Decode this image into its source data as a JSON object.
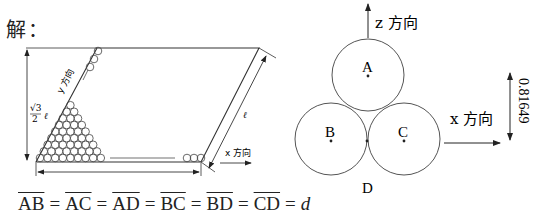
{
  "header": {
    "label": "解："
  },
  "left_figure": {
    "height_label_num": "√3",
    "height_label_den": "2",
    "height_label_var": "ℓ",
    "side_label": "ℓ",
    "y_direction_label": "y 方向",
    "x_direction_label": "x 方向",
    "bottom_label": "–"
  },
  "right_figure": {
    "z_direction_label": "z 方向",
    "x_direction_label": "x 方向",
    "points": [
      "A",
      "B",
      "C",
      "D"
    ],
    "dimension_value": "0.81649"
  },
  "formula": {
    "segments": [
      "AB",
      "AC",
      "AD",
      "BC",
      "BD",
      "CD"
    ],
    "equals": "=",
    "result": "d"
  }
}
